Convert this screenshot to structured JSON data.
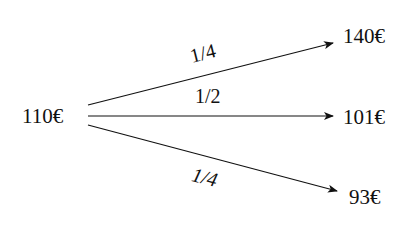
{
  "diagram": {
    "type": "probability-tree",
    "root": {
      "label": "110€"
    },
    "branches": [
      {
        "probability": "1/4",
        "outcome": "140€"
      },
      {
        "probability": "1/2",
        "outcome": "101€"
      },
      {
        "probability": "1/4",
        "outcome": "93€"
      }
    ]
  }
}
